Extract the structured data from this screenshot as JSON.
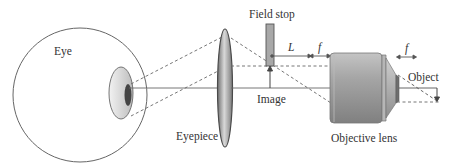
{
  "diagram": {
    "labels": {
      "eye": "Eye",
      "eyepiece": "Eyepiece",
      "field_stop": "Field stop",
      "image": "Image",
      "objective_lens": "Objective lens",
      "object": "Object",
      "L": "L",
      "f_tube": "f",
      "f_object": "f"
    },
    "colors": {
      "line": "#555555",
      "lens_dark": "#555555",
      "lens_mid": "#9a9a9a",
      "lens_light": "#d6d6d6",
      "field_stop_fill": "#a8a8a8",
      "pupil": "#444444"
    }
  }
}
